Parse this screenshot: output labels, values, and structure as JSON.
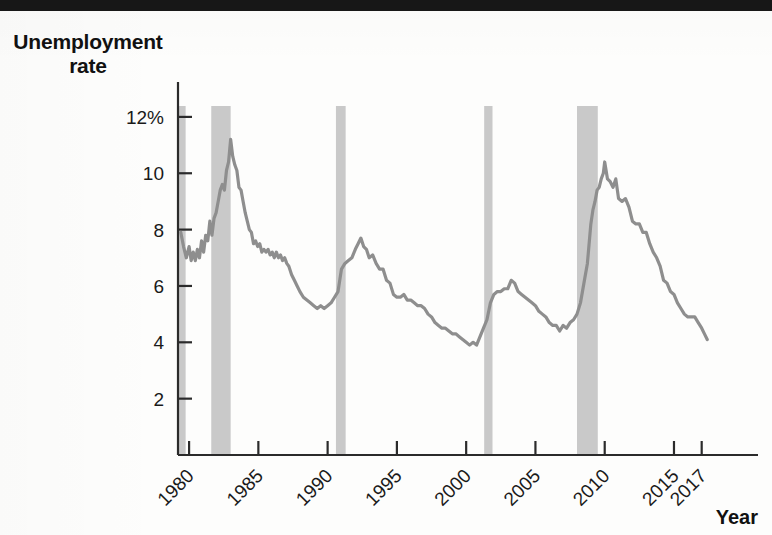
{
  "figure": {
    "y_axis_title": "Unemployment\nrate",
    "y_axis_title_line1": "Unemployment",
    "y_axis_title_line2": "rate",
    "x_axis_title": "Year"
  },
  "colors": {
    "line": "#8e8e8e",
    "recession_band": "#c9c9c9",
    "axis": "#2b2b2b",
    "text": "#111111",
    "background": "#fdfdfc"
  },
  "chart_data": {
    "type": "line",
    "title": "",
    "xlabel": "Year",
    "ylabel": "Unemployment rate",
    "xlim": [
      1979.2,
      2017.6
    ],
    "ylim": [
      0,
      12.6
    ],
    "grid": false,
    "legend": "none",
    "y_tick_values": [
      2,
      4,
      6,
      8,
      10,
      12
    ],
    "y_tick_labels": [
      "2",
      "4",
      "6",
      "8",
      "10",
      "12%"
    ],
    "x_tick_values": [
      1980,
      1985,
      1990,
      1995,
      2000,
      2005,
      2010,
      2015,
      2017
    ],
    "x_tick_labels": [
      "1980",
      "1985",
      "1990",
      "1995",
      "2000",
      "2005",
      "2010",
      "2015",
      "2017"
    ],
    "x_tick_label_rotation": 45,
    "shaded_regions": [
      {
        "name": "recession-1981-1982",
        "x0": 1981.6,
        "x1": 1983.0
      },
      {
        "name": "recession-1990-1991",
        "x0": 1990.6,
        "x1": 1991.3
      },
      {
        "name": "recession-2001",
        "x0": 2001.3,
        "x1": 2001.9
      },
      {
        "name": "recession-2007-2009",
        "x0": 2008.0,
        "x1": 2009.5
      },
      {
        "name": "left-margin-band",
        "x0": 1979.25,
        "x1": 1979.75
      }
    ],
    "series": [
      {
        "name": "Unemployment rate",
        "x": [
          1979.4,
          1979.6,
          1979.8,
          1980.0,
          1980.15,
          1980.3,
          1980.45,
          1980.6,
          1980.75,
          1980.9,
          1981.05,
          1981.2,
          1981.35,
          1981.5,
          1981.65,
          1981.8,
          1981.95,
          1982.1,
          1982.25,
          1982.4,
          1982.55,
          1982.7,
          1982.85,
          1983.0,
          1983.15,
          1983.3,
          1983.45,
          1983.6,
          1983.75,
          1983.9,
          1984.05,
          1984.2,
          1984.35,
          1984.5,
          1984.65,
          1984.8,
          1984.95,
          1985.1,
          1985.25,
          1985.4,
          1985.55,
          1985.7,
          1985.85,
          1986.0,
          1986.15,
          1986.3,
          1986.45,
          1986.6,
          1986.75,
          1986.9,
          1987.05,
          1987.2,
          1987.4,
          1987.6,
          1987.8,
          1988.0,
          1988.25,
          1988.5,
          1988.75,
          1989.0,
          1989.25,
          1989.5,
          1989.75,
          1990.0,
          1990.25,
          1990.5,
          1990.75,
          1991.0,
          1991.25,
          1991.5,
          1991.75,
          1992.0,
          1992.2,
          1992.4,
          1992.6,
          1992.8,
          1993.0,
          1993.25,
          1993.5,
          1993.75,
          1994.0,
          1994.25,
          1994.5,
          1994.75,
          1995.0,
          1995.25,
          1995.5,
          1995.75,
          1996.0,
          1996.25,
          1996.5,
          1996.75,
          1997.0,
          1997.25,
          1997.5,
          1997.75,
          1998.0,
          1998.25,
          1998.5,
          1998.75,
          1999.0,
          1999.25,
          1999.5,
          1999.75,
          2000.0,
          2000.25,
          2000.5,
          2000.75,
          2001.0,
          2001.25,
          2001.5,
          2001.75,
          2002.0,
          2002.25,
          2002.5,
          2002.75,
          2003.0,
          2003.25,
          2003.5,
          2003.75,
          2004.0,
          2004.25,
          2004.5,
          2004.75,
          2005.0,
          2005.25,
          2005.5,
          2005.75,
          2006.0,
          2006.25,
          2006.5,
          2006.75,
          2007.0,
          2007.25,
          2007.5,
          2007.75,
          2008.0,
          2008.25,
          2008.5,
          2008.75,
          2009.0,
          2009.15,
          2009.3,
          2009.45,
          2009.6,
          2009.75,
          2009.9,
          2010.0,
          2010.2,
          2010.4,
          2010.6,
          2010.8,
          2011.0,
          2011.25,
          2011.5,
          2011.75,
          2012.0,
          2012.25,
          2012.5,
          2012.75,
          2013.0,
          2013.25,
          2013.5,
          2013.75,
          2014.0,
          2014.25,
          2014.5,
          2014.75,
          2015.0,
          2015.25,
          2015.5,
          2015.75,
          2016.0,
          2016.25,
          2016.5,
          2016.75,
          2017.0,
          2017.2,
          2017.4
        ],
        "y": [
          7.9,
          7.4,
          7.0,
          7.4,
          6.9,
          7.2,
          6.9,
          7.3,
          7.0,
          7.6,
          7.2,
          7.8,
          7.6,
          8.3,
          7.8,
          8.4,
          8.6,
          9.0,
          9.4,
          9.6,
          9.4,
          10.1,
          10.4,
          11.2,
          10.6,
          10.3,
          10.1,
          9.5,
          9.4,
          9.0,
          8.6,
          8.3,
          8.0,
          7.9,
          7.5,
          7.6,
          7.4,
          7.5,
          7.2,
          7.3,
          7.2,
          7.3,
          7.1,
          7.2,
          7.0,
          7.2,
          7.0,
          7.1,
          6.9,
          7.0,
          6.8,
          6.7,
          6.4,
          6.2,
          6.0,
          5.8,
          5.6,
          5.5,
          5.4,
          5.3,
          5.2,
          5.3,
          5.2,
          5.3,
          5.4,
          5.6,
          5.8,
          6.6,
          6.8,
          6.9,
          7.0,
          7.3,
          7.5,
          7.7,
          7.4,
          7.3,
          7.0,
          7.1,
          6.8,
          6.6,
          6.6,
          6.2,
          6.1,
          5.7,
          5.6,
          5.6,
          5.7,
          5.5,
          5.5,
          5.4,
          5.3,
          5.3,
          5.2,
          5.0,
          4.9,
          4.7,
          4.6,
          4.5,
          4.5,
          4.4,
          4.3,
          4.3,
          4.2,
          4.1,
          4.0,
          3.9,
          4.0,
          3.9,
          4.2,
          4.5,
          4.8,
          5.4,
          5.7,
          5.8,
          5.8,
          5.9,
          5.9,
          6.2,
          6.1,
          5.8,
          5.7,
          5.6,
          5.5,
          5.4,
          5.3,
          5.1,
          5.0,
          4.9,
          4.7,
          4.6,
          4.6,
          4.4,
          4.6,
          4.5,
          4.7,
          4.8,
          5.0,
          5.4,
          6.1,
          6.8,
          8.2,
          8.7,
          9.0,
          9.4,
          9.5,
          9.8,
          10.0,
          10.4,
          9.8,
          9.7,
          9.5,
          9.8,
          9.1,
          9.0,
          9.1,
          8.8,
          8.3,
          8.2,
          8.2,
          7.9,
          7.9,
          7.5,
          7.2,
          7.0,
          6.7,
          6.2,
          6.1,
          5.8,
          5.7,
          5.4,
          5.2,
          5.0,
          4.9,
          4.9,
          4.9,
          4.7,
          4.5,
          4.3,
          4.1
        ]
      }
    ],
    "annotations": [
      {
        "text": "12%",
        "type": "y-tick"
      },
      {
        "text": "Year",
        "type": "axis-title"
      }
    ]
  }
}
